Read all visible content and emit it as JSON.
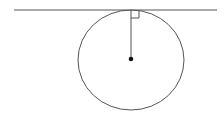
{
  "diagram": {
    "title": "",
    "colors": {
      "stroke": "#555555",
      "background": "#ffffff",
      "dot": "#111111"
    },
    "tangent_line": {
      "x1": 14,
      "y1": 10,
      "x2": 217,
      "y2": 10
    },
    "circle": {
      "cx": 131,
      "cy": 60,
      "rx": 53,
      "ry": 50
    },
    "radius": {
      "x1": 131,
      "y1": 10,
      "x2": 131,
      "y2": 59
    },
    "center_point": {
      "cx": 131,
      "cy": 59,
      "r": 2.3
    },
    "right_angle_marker": {
      "x": 131,
      "y": 10,
      "size": 8
    }
  }
}
